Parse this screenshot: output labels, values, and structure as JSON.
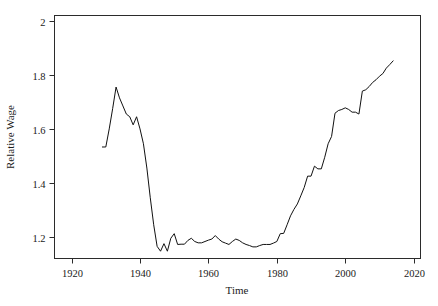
{
  "chart_data": {
    "type": "line",
    "title": "",
    "xlabel": "Time",
    "ylabel": "Relative Wage",
    "xlim": [
      1915,
      2022
    ],
    "ylim": [
      1.12,
      2.02
    ],
    "xticks": [
      1920,
      1940,
      1960,
      1980,
      2000,
      2020
    ],
    "xtick_labels": [
      "1920",
      "1940",
      "1960",
      "1980",
      "2000",
      "2020"
    ],
    "yticks": [
      1.2,
      1.4,
      1.6,
      1.8,
      2.0
    ],
    "ytick_labels": [
      "1.2",
      "1.4",
      "1.6",
      "1.8",
      "2"
    ],
    "grid": false,
    "legend": "none",
    "line_color": "#111111",
    "series": [
      {
        "name": "Relative Wage",
        "x": [
          1929,
          1930,
          1931,
          1932,
          1933,
          1934,
          1935,
          1936,
          1937,
          1938,
          1939,
          1940,
          1941,
          1942,
          1943,
          1944,
          1945,
          1946,
          1947,
          1948,
          1949,
          1950,
          1951,
          1952,
          1953,
          1954,
          1955,
          1956,
          1957,
          1958,
          1959,
          1960,
          1961,
          1962,
          1963,
          1964,
          1965,
          1966,
          1967,
          1968,
          1969,
          1970,
          1971,
          1972,
          1973,
          1974,
          1975,
          1976,
          1977,
          1978,
          1979,
          1980,
          1981,
          1982,
          1983,
          1984,
          1985,
          1986,
          1987,
          1988,
          1989,
          1990,
          1991,
          1992,
          1993,
          1994,
          1995,
          1996,
          1997,
          1998,
          1999,
          2000,
          2001,
          2002,
          2003,
          2004,
          2005,
          2006,
          2007,
          2008,
          2009,
          2010,
          2011,
          2012,
          2013,
          2014
        ],
        "y": [
          1.533,
          1.533,
          1.6,
          1.675,
          1.755,
          1.715,
          1.685,
          1.655,
          1.645,
          1.615,
          1.645,
          1.6,
          1.545,
          1.455,
          1.345,
          1.245,
          1.165,
          1.147,
          1.175,
          1.147,
          1.195,
          1.212,
          1.172,
          1.173,
          1.173,
          1.187,
          1.195,
          1.183,
          1.178,
          1.178,
          1.183,
          1.188,
          1.192,
          1.205,
          1.192,
          1.182,
          1.177,
          1.172,
          1.183,
          1.192,
          1.187,
          1.178,
          1.172,
          1.168,
          1.163,
          1.163,
          1.168,
          1.172,
          1.172,
          1.172,
          1.177,
          1.183,
          1.212,
          1.213,
          1.245,
          1.278,
          1.302,
          1.322,
          1.352,
          1.383,
          1.425,
          1.425,
          1.462,
          1.452,
          1.452,
          1.495,
          1.545,
          1.572,
          1.658,
          1.668,
          1.672,
          1.678,
          1.672,
          1.662,
          1.662,
          1.655,
          1.74,
          1.745,
          1.757,
          1.772,
          1.782,
          1.795,
          1.805,
          1.825,
          1.838,
          1.852
        ]
      }
    ]
  },
  "axes": {
    "ylabel_text": "Relative Wage",
    "xlabel_text": "Time"
  }
}
